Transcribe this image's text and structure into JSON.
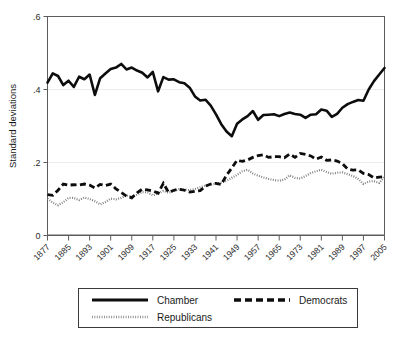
{
  "chart_data": {
    "type": "line",
    "title": "",
    "subtitle": "",
    "xlabel": "",
    "ylabel": "Standard deviations",
    "xlim": [
      1877,
      2005
    ],
    "ylim": [
      0,
      0.6
    ],
    "grid": true,
    "grid_axis": "y",
    "legend_position": "bottom",
    "y_ticks": [
      0,
      0.2,
      0.4,
      0.6
    ],
    "y_tick_labels": [
      "0",
      ".2",
      ".4",
      ".6"
    ],
    "x_tick_labels": [
      "1877",
      "1885",
      "1893",
      "1901",
      "1909",
      "1917",
      "1925",
      "1933",
      "1941",
      "1949",
      "1957",
      "1965",
      "1973",
      "1981",
      "1989",
      "1997",
      "2005"
    ],
    "x_tick_values": [
      1877,
      1885,
      1893,
      1901,
      1909,
      1917,
      1925,
      1933,
      1941,
      1949,
      1957,
      1965,
      1973,
      1981,
      1989,
      1997,
      2005
    ],
    "x": [
      1877,
      1879,
      1881,
      1883,
      1885,
      1887,
      1889,
      1891,
      1893,
      1895,
      1897,
      1899,
      1901,
      1903,
      1905,
      1907,
      1909,
      1911,
      1913,
      1915,
      1917,
      1919,
      1921,
      1923,
      1925,
      1927,
      1929,
      1931,
      1933,
      1935,
      1937,
      1939,
      1941,
      1943,
      1945,
      1947,
      1949,
      1951,
      1953,
      1955,
      1957,
      1959,
      1961,
      1963,
      1965,
      1967,
      1969,
      1971,
      1973,
      1975,
      1977,
      1979,
      1981,
      1983,
      1985,
      1987,
      1989,
      1991,
      1993,
      1995,
      1997,
      1999,
      2001,
      2003,
      2005
    ],
    "series": [
      {
        "name": "Chamber",
        "style": "solid",
        "color": "#0d0d0d",
        "values": [
          0.419,
          0.444,
          0.437,
          0.412,
          0.424,
          0.407,
          0.435,
          0.428,
          0.441,
          0.385,
          0.431,
          0.444,
          0.456,
          0.46,
          0.47,
          0.455,
          0.46,
          0.452,
          0.446,
          0.433,
          0.448,
          0.395,
          0.434,
          0.427,
          0.428,
          0.42,
          0.417,
          0.405,
          0.381,
          0.37,
          0.372,
          0.356,
          0.332,
          0.305,
          0.285,
          0.272,
          0.306,
          0.318,
          0.327,
          0.341,
          0.317,
          0.33,
          0.331,
          0.332,
          0.327,
          0.333,
          0.337,
          0.333,
          0.331,
          0.322,
          0.331,
          0.332,
          0.345,
          0.342,
          0.325,
          0.333,
          0.35,
          0.36,
          0.366,
          0.371,
          0.369,
          0.4,
          0.423,
          0.441,
          0.459
        ]
      },
      {
        "name": "Democrats",
        "style": "dashed",
        "color": "#0d0d0d",
        "values": [
          0.112,
          0.11,
          0.124,
          0.141,
          0.138,
          0.139,
          0.138,
          0.141,
          0.138,
          0.13,
          0.14,
          0.137,
          0.141,
          0.128,
          0.118,
          0.108,
          0.103,
          0.117,
          0.127,
          0.125,
          0.122,
          0.116,
          0.143,
          0.118,
          0.124,
          0.127,
          0.124,
          0.119,
          0.121,
          0.123,
          0.135,
          0.141,
          0.143,
          0.14,
          0.165,
          0.185,
          0.206,
          0.203,
          0.207,
          0.214,
          0.219,
          0.221,
          0.214,
          0.216,
          0.216,
          0.213,
          0.223,
          0.214,
          0.225,
          0.222,
          0.218,
          0.209,
          0.215,
          0.206,
          0.207,
          0.204,
          0.197,
          0.182,
          0.179,
          0.18,
          0.17,
          0.167,
          0.158,
          0.16,
          0.161
        ]
      },
      {
        "name": "Republicans",
        "style": "dotted",
        "color": "#7a7a7a",
        "values": [
          0.101,
          0.09,
          0.083,
          0.091,
          0.103,
          0.103,
          0.097,
          0.104,
          0.1,
          0.094,
          0.085,
          0.092,
          0.101,
          0.099,
          0.103,
          0.11,
          0.106,
          0.112,
          0.119,
          0.118,
          0.11,
          0.115,
          0.122,
          0.117,
          0.122,
          0.127,
          0.126,
          0.124,
          0.127,
          0.132,
          0.137,
          0.139,
          0.142,
          0.145,
          0.15,
          0.158,
          0.166,
          0.176,
          0.18,
          0.17,
          0.164,
          0.159,
          0.155,
          0.152,
          0.15,
          0.153,
          0.165,
          0.158,
          0.156,
          0.163,
          0.171,
          0.176,
          0.18,
          0.174,
          0.169,
          0.172,
          0.173,
          0.168,
          0.163,
          0.155,
          0.141,
          0.148,
          0.149,
          0.144,
          0.161
        ]
      }
    ]
  },
  "legend": {
    "entries": [
      {
        "label": "Chamber",
        "sample": "solid-line-sample"
      },
      {
        "label": "Democrats",
        "sample": "dashed-line-sample"
      },
      {
        "label": "Republicans",
        "sample": "dotted-line-sample"
      }
    ]
  }
}
